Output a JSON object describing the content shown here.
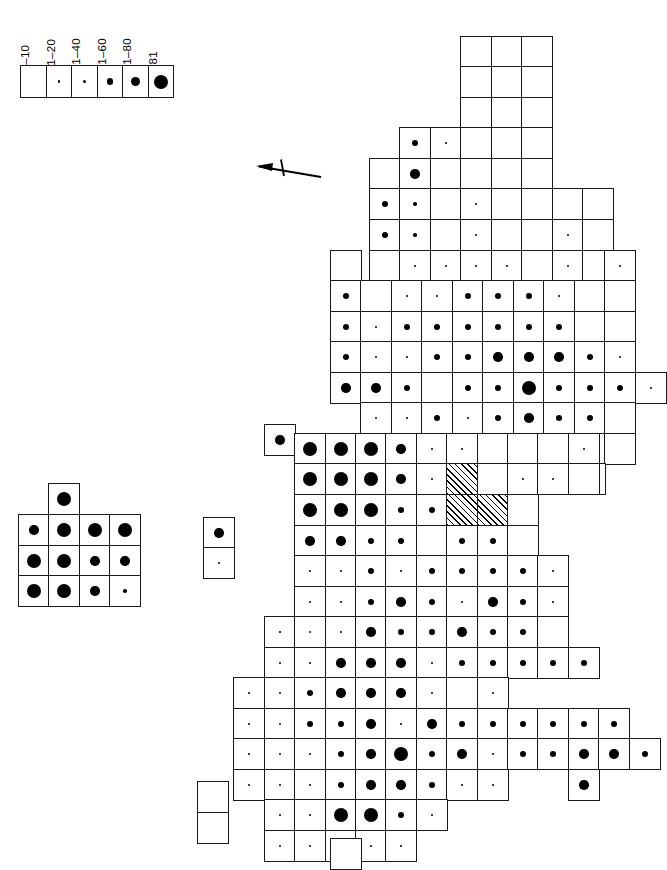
{
  "figure": {
    "type": "distribution-dot-map",
    "orientation": "rotated-90-north-left",
    "background_color": "#ffffff",
    "ink_color": "#000000",
    "grid_cell_px": 30.5
  },
  "legend": {
    "name": "record-count-legend",
    "classes": [
      {
        "label": "1–10",
        "dot_class": "d0",
        "dot_px": 0
      },
      {
        "label": "11–20",
        "dot_class": "d1",
        "dot_px": 2.2
      },
      {
        "label": "21–40",
        "dot_class": "d2",
        "dot_px": 3.6
      },
      {
        "label": "41–60",
        "dot_class": "d3",
        "dot_px": 6.2
      },
      {
        "label": "61–80",
        "dot_class": "d4",
        "dot_px": 9.4
      },
      {
        "label": ">81",
        "dot_class": "d5",
        "dot_px": 14
      }
    ]
  },
  "north_arrow": {
    "label": "",
    "points": "left"
  },
  "chart_data": {
    "type": "heatmap",
    "title": "",
    "xlabel": "",
    "ylabel": "",
    "legend_position": "top-left",
    "grid": true,
    "value_classes": [
      "1–10",
      "11–20",
      "21–40",
      "41–60",
      "61–80",
      ">81"
    ],
    "cell_size_px": 30.5,
    "origin_px": [
      330,
      36
    ],
    "note": "Each occupied grid square carries a dot whose diameter encodes the record-count class; hatched squares are excluded / no-data.",
    "main_map_cells": [
      [
        460,
        36,
        "d0"
      ],
      [
        491,
        36,
        "d0"
      ],
      [
        521,
        36,
        "d0"
      ],
      [
        460,
        66,
        "d0"
      ],
      [
        491,
        66,
        "d0"
      ],
      [
        521,
        66,
        "d0"
      ],
      [
        460,
        97,
        "d0"
      ],
      [
        491,
        97,
        "d0"
      ],
      [
        521,
        97,
        "d0"
      ],
      [
        399,
        127,
        "d3"
      ],
      [
        430,
        127,
        "d1"
      ],
      [
        460,
        127,
        "d0"
      ],
      [
        491,
        127,
        "d0"
      ],
      [
        521,
        127,
        "d0"
      ],
      [
        369,
        158,
        "d0"
      ],
      [
        399,
        158,
        "d4"
      ],
      [
        430,
        158,
        "d0"
      ],
      [
        460,
        158,
        "d0"
      ],
      [
        491,
        158,
        "d0"
      ],
      [
        521,
        158,
        "d0"
      ],
      [
        369,
        188,
        "d3"
      ],
      [
        399,
        188,
        "d2"
      ],
      [
        430,
        188,
        "d0"
      ],
      [
        460,
        188,
        "d1"
      ],
      [
        491,
        188,
        "d0"
      ],
      [
        521,
        188,
        "d0"
      ],
      [
        552,
        188,
        "d0"
      ],
      [
        582,
        188,
        "d0"
      ],
      [
        369,
        219,
        "d3"
      ],
      [
        399,
        219,
        "d2"
      ],
      [
        430,
        219,
        "d0"
      ],
      [
        460,
        219,
        "d1"
      ],
      [
        491,
        219,
        "d0"
      ],
      [
        521,
        219,
        "d0"
      ],
      [
        552,
        219,
        "d1"
      ],
      [
        582,
        219,
        "d0"
      ],
      [
        369,
        250,
        "d0"
      ],
      [
        399,
        250,
        "d1"
      ],
      [
        430,
        250,
        "d1"
      ],
      [
        460,
        250,
        "d1"
      ],
      [
        491,
        250,
        "d1"
      ],
      [
        521,
        250,
        "d0"
      ],
      [
        552,
        250,
        "d1"
      ],
      [
        582,
        250,
        "d0"
      ],
      [
        604,
        250,
        "d1"
      ],
      [
        330,
        250,
        "d0"
      ],
      [
        330,
        280,
        "d3"
      ],
      [
        360,
        280,
        "d0"
      ],
      [
        391,
        280,
        "d1"
      ],
      [
        421,
        280,
        "d1"
      ],
      [
        452,
        280,
        "d3"
      ],
      [
        482,
        280,
        "d3"
      ],
      [
        513,
        280,
        "d3"
      ],
      [
        543,
        280,
        "d1"
      ],
      [
        574,
        280,
        "d0"
      ],
      [
        604,
        280,
        "d0"
      ],
      [
        330,
        311,
        "d3"
      ],
      [
        360,
        311,
        "d1"
      ],
      [
        391,
        311,
        "d3"
      ],
      [
        421,
        311,
        "d3"
      ],
      [
        452,
        311,
        "d3"
      ],
      [
        482,
        311,
        "d3"
      ],
      [
        513,
        311,
        "d3"
      ],
      [
        543,
        311,
        "d3"
      ],
      [
        574,
        311,
        "d0"
      ],
      [
        604,
        311,
        "d0"
      ],
      [
        330,
        341,
        "d3"
      ],
      [
        360,
        341,
        "d1"
      ],
      [
        391,
        341,
        "d1"
      ],
      [
        421,
        341,
        "d3"
      ],
      [
        452,
        341,
        "d3"
      ],
      [
        482,
        341,
        "d4"
      ],
      [
        513,
        341,
        "d4"
      ],
      [
        543,
        341,
        "d4"
      ],
      [
        574,
        341,
        "d3"
      ],
      [
        604,
        341,
        "d1"
      ],
      [
        330,
        372,
        "d4"
      ],
      [
        360,
        372,
        "d4"
      ],
      [
        391,
        372,
        "d3"
      ],
      [
        421,
        372,
        "d0"
      ],
      [
        452,
        372,
        "d3"
      ],
      [
        482,
        372,
        "d3"
      ],
      [
        513,
        372,
        "d5"
      ],
      [
        543,
        372,
        "d3"
      ],
      [
        574,
        372,
        "d3"
      ],
      [
        604,
        372,
        "d3"
      ],
      [
        635,
        372,
        "d1"
      ],
      [
        360,
        402,
        "d1"
      ],
      [
        391,
        402,
        "d1"
      ],
      [
        421,
        402,
        "d3"
      ],
      [
        452,
        402,
        "d1"
      ],
      [
        482,
        402,
        "d3"
      ],
      [
        513,
        402,
        "d4"
      ],
      [
        543,
        402,
        "d3"
      ],
      [
        574,
        402,
        "d3"
      ],
      [
        604,
        402,
        "d0"
      ],
      [
        391,
        433,
        "d3"
      ],
      [
        421,
        433,
        "d3"
      ],
      [
        452,
        433,
        "d1"
      ],
      [
        482,
        433,
        "d1"
      ],
      [
        513,
        433,
        "d1"
      ],
      [
        543,
        433,
        "d1"
      ],
      [
        574,
        433,
        "d1"
      ],
      [
        604,
        433,
        "d0"
      ],
      [
        360,
        463,
        "d3"
      ],
      [
        391,
        463,
        "d3"
      ],
      [
        421,
        463,
        "d3"
      ],
      [
        452,
        463,
        "d3"
      ],
      [
        482,
        463,
        "d1"
      ],
      [
        513,
        463,
        "d1"
      ],
      [
        543,
        463,
        "d0"
      ],
      [
        574,
        463,
        "d0"
      ],
      [
        264,
        424,
        "d4"
      ],
      [
        294,
        433,
        "d5"
      ],
      [
        325,
        433,
        "d5"
      ],
      [
        355,
        433,
        "d5"
      ],
      [
        385,
        433,
        "d4"
      ],
      [
        416,
        433,
        "d1"
      ],
      [
        446,
        433,
        "d1"
      ],
      [
        477,
        433,
        "d0"
      ],
      [
        507,
        433,
        "d0"
      ],
      [
        537,
        433,
        "d0"
      ],
      [
        568,
        433,
        "d1"
      ],
      [
        294,
        463,
        "d5"
      ],
      [
        325,
        463,
        "d5"
      ],
      [
        355,
        463,
        "d5"
      ],
      [
        385,
        463,
        "d4"
      ],
      [
        416,
        463,
        "d1"
      ],
      [
        446,
        463,
        "hatch"
      ],
      [
        477,
        463,
        "d0"
      ],
      [
        507,
        463,
        "d1"
      ],
      [
        537,
        463,
        "d1"
      ],
      [
        568,
        463,
        "d0"
      ],
      [
        294,
        494,
        "d5"
      ],
      [
        325,
        494,
        "d5"
      ],
      [
        355,
        494,
        "d5"
      ],
      [
        385,
        494,
        "d3"
      ],
      [
        416,
        494,
        "d3"
      ],
      [
        446,
        494,
        "hatch"
      ],
      [
        477,
        494,
        "hatch"
      ],
      [
        507,
        494,
        "d0"
      ],
      [
        294,
        525,
        "d4"
      ],
      [
        325,
        525,
        "d4"
      ],
      [
        355,
        525,
        "d3"
      ],
      [
        385,
        525,
        "d3"
      ],
      [
        416,
        525,
        "d0"
      ],
      [
        446,
        525,
        "d3"
      ],
      [
        477,
        525,
        "d3"
      ],
      [
        507,
        525,
        "d0"
      ],
      [
        294,
        555,
        "d1"
      ],
      [
        325,
        555,
        "d1"
      ],
      [
        355,
        555,
        "d3"
      ],
      [
        385,
        555,
        "d1"
      ],
      [
        416,
        555,
        "d3"
      ],
      [
        446,
        555,
        "d3"
      ],
      [
        477,
        555,
        "d3"
      ],
      [
        507,
        555,
        "d3"
      ],
      [
        537,
        555,
        "d1"
      ],
      [
        294,
        586,
        "d1"
      ],
      [
        325,
        586,
        "d1"
      ],
      [
        355,
        586,
        "d3"
      ],
      [
        385,
        586,
        "d4"
      ],
      [
        416,
        586,
        "d3"
      ],
      [
        446,
        586,
        "d1"
      ],
      [
        477,
        586,
        "d4"
      ],
      [
        507,
        586,
        "d3"
      ],
      [
        537,
        586,
        "d1"
      ],
      [
        264,
        616,
        "d1"
      ],
      [
        294,
        616,
        "d1"
      ],
      [
        325,
        616,
        "d1"
      ],
      [
        355,
        616,
        "d4"
      ],
      [
        385,
        616,
        "d3"
      ],
      [
        416,
        616,
        "d3"
      ],
      [
        446,
        616,
        "d4"
      ],
      [
        477,
        616,
        "d3"
      ],
      [
        507,
        616,
        "d3"
      ],
      [
        537,
        616,
        "d0"
      ],
      [
        264,
        647,
        "d1"
      ],
      [
        294,
        647,
        "d1"
      ],
      [
        325,
        647,
        "d4"
      ],
      [
        355,
        647,
        "d4"
      ],
      [
        385,
        647,
        "d4"
      ],
      [
        416,
        647,
        "d1"
      ],
      [
        446,
        647,
        "d3"
      ],
      [
        477,
        647,
        "d3"
      ],
      [
        507,
        647,
        "d3"
      ],
      [
        537,
        647,
        "d3"
      ],
      [
        568,
        647,
        "d3"
      ],
      [
        233,
        677,
        "d1"
      ],
      [
        264,
        677,
        "d1"
      ],
      [
        294,
        677,
        "d3"
      ],
      [
        325,
        677,
        "d4"
      ],
      [
        355,
        677,
        "d4"
      ],
      [
        385,
        677,
        "d4"
      ],
      [
        416,
        677,
        "d1"
      ],
      [
        446,
        677,
        "d0"
      ],
      [
        477,
        677,
        "d1"
      ],
      [
        233,
        708,
        "d1"
      ],
      [
        264,
        708,
        "d1"
      ],
      [
        294,
        708,
        "d3"
      ],
      [
        325,
        708,
        "d3"
      ],
      [
        355,
        708,
        "d4"
      ],
      [
        385,
        708,
        "d1"
      ],
      [
        416,
        708,
        "d4"
      ],
      [
        446,
        708,
        "d3"
      ],
      [
        477,
        708,
        "d3"
      ],
      [
        507,
        708,
        "d3"
      ],
      [
        537,
        708,
        "d3"
      ],
      [
        568,
        708,
        "d3"
      ],
      [
        598,
        708,
        "d3"
      ],
      [
        233,
        738,
        "d1"
      ],
      [
        264,
        738,
        "d1"
      ],
      [
        294,
        738,
        "d1"
      ],
      [
        325,
        738,
        "d3"
      ],
      [
        355,
        738,
        "d4"
      ],
      [
        385,
        738,
        "d5"
      ],
      [
        416,
        738,
        "d3"
      ],
      [
        446,
        738,
        "d4"
      ],
      [
        477,
        738,
        "d1"
      ],
      [
        507,
        738,
        "d3"
      ],
      [
        537,
        738,
        "d3"
      ],
      [
        568,
        738,
        "d4"
      ],
      [
        598,
        738,
        "d4"
      ],
      [
        629,
        738,
        "d3"
      ],
      [
        233,
        769,
        "d1"
      ],
      [
        264,
        769,
        "d1"
      ],
      [
        294,
        769,
        "d1"
      ],
      [
        325,
        769,
        "d3"
      ],
      [
        355,
        769,
        "d4"
      ],
      [
        385,
        769,
        "d4"
      ],
      [
        416,
        769,
        "d3"
      ],
      [
        446,
        769,
        "d1"
      ],
      [
        477,
        769,
        "d1"
      ],
      [
        568,
        769,
        "d4"
      ],
      [
        264,
        799,
        "d1"
      ],
      [
        294,
        799,
        "d1"
      ],
      [
        325,
        799,
        "d5"
      ],
      [
        355,
        799,
        "d5"
      ],
      [
        385,
        799,
        "d3"
      ],
      [
        416,
        799,
        "d1"
      ],
      [
        264,
        830,
        "d1"
      ],
      [
        294,
        830,
        "d1"
      ],
      [
        325,
        830,
        "d1"
      ],
      [
        355,
        830,
        "d1"
      ],
      [
        385,
        830,
        "d1"
      ]
    ],
    "inset_channel_islands": {
      "label": "",
      "origin_px": [
        18,
        483
      ],
      "cells": [
        [
          48,
          483,
          "d5"
        ],
        [
          18,
          514,
          "d4"
        ],
        [
          48,
          514,
          "d5"
        ],
        [
          79,
          514,
          "d5"
        ],
        [
          109,
          514,
          "d5"
        ],
        [
          18,
          545,
          "d5"
        ],
        [
          48,
          545,
          "d5"
        ],
        [
          79,
          545,
          "d4"
        ],
        [
          109,
          545,
          "d4"
        ],
        [
          18,
          575,
          "d5"
        ],
        [
          48,
          575,
          "d5"
        ],
        [
          79,
          575,
          "d4"
        ],
        [
          109,
          575,
          "d2"
        ]
      ]
    },
    "inset_outlier_small": {
      "label": "",
      "origin_px": [
        203,
        517
      ],
      "cells": [
        [
          203,
          517,
          "d4"
        ],
        [
          203,
          547,
          "d1"
        ]
      ]
    },
    "inset_blank_pair": {
      "label": "",
      "origin_px": [
        197,
        781
      ],
      "cells": [
        [
          197,
          781,
          "d0"
        ],
        [
          197,
          812,
          "d0"
        ]
      ]
    },
    "inset_blank_single": {
      "label": "",
      "origin_px": [
        330,
        838
      ],
      "cells": [
        [
          330,
          838,
          "d0"
        ]
      ]
    }
  }
}
